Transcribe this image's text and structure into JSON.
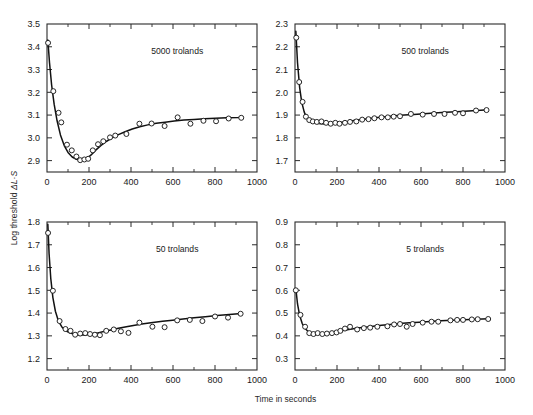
{
  "axes": {
    "ylabel_text": "Log threshold ",
    "ylabel_symbol": "ΔL·S",
    "xlabel": "Time in seconds"
  },
  "style": {
    "curve_color": "#111111",
    "marker_fill": "#ffffff",
    "marker_stroke": "#1a1a1a",
    "frame_color": "#2b2b2b",
    "background": "#ffffff"
  },
  "chart_data": [
    {
      "type": "scatter",
      "title": "5000 trolands",
      "panel": "top-left",
      "xlabel": "Time in seconds",
      "ylabel": "Log threshold ΔL·S",
      "xlim": [
        0,
        1000
      ],
      "ylim": [
        2.85,
        3.5
      ],
      "xticks": [
        0,
        200,
        400,
        600,
        800,
        1000
      ],
      "yticks": [
        2.9,
        3.0,
        3.1,
        3.2,
        3.3,
        3.4,
        3.5
      ],
      "ytick_labels": [
        "2.9",
        "3.0",
        "3.1",
        "3.2",
        "3.3",
        "3.4",
        "3.5"
      ],
      "xtick_labels": [
        "0",
        "200",
        "400",
        "600",
        "800",
        "1000"
      ],
      "minor_xtick_step": 100,
      "grid": false,
      "legend": null,
      "points": [
        [
          5,
          3.417
        ],
        [
          30,
          3.205
        ],
        [
          55,
          3.11
        ],
        [
          68,
          3.068
        ],
        [
          95,
          2.97
        ],
        [
          118,
          2.945
        ],
        [
          140,
          2.918
        ],
        [
          158,
          2.902
        ],
        [
          178,
          2.905
        ],
        [
          196,
          2.908
        ],
        [
          218,
          2.945
        ],
        [
          243,
          2.972
        ],
        [
          268,
          2.985
        ],
        [
          300,
          3.002
        ],
        [
          325,
          3.01
        ],
        [
          378,
          3.017
        ],
        [
          440,
          3.062
        ],
        [
          498,
          3.063
        ],
        [
          560,
          3.052
        ],
        [
          622,
          3.09
        ],
        [
          683,
          3.062
        ],
        [
          745,
          3.075
        ],
        [
          805,
          3.073
        ],
        [
          865,
          3.085
        ],
        [
          925,
          3.088
        ]
      ],
      "curve": [
        [
          4,
          3.43
        ],
        [
          12,
          3.33
        ],
        [
          22,
          3.232
        ],
        [
          34,
          3.148
        ],
        [
          48,
          3.075
        ],
        [
          64,
          3.013
        ],
        [
          82,
          2.966
        ],
        [
          100,
          2.936
        ],
        [
          120,
          2.916
        ],
        [
          140,
          2.906
        ],
        [
          160,
          2.902
        ],
        [
          175,
          2.903
        ],
        [
          190,
          2.909
        ],
        [
          210,
          2.925
        ],
        [
          232,
          2.946
        ],
        [
          256,
          2.966
        ],
        [
          282,
          2.984
        ],
        [
          310,
          3.0
        ],
        [
          340,
          3.014
        ],
        [
          372,
          3.027
        ],
        [
          406,
          3.039
        ],
        [
          442,
          3.049
        ],
        [
          480,
          3.057
        ],
        [
          520,
          3.064
        ],
        [
          562,
          3.069
        ],
        [
          606,
          3.074
        ],
        [
          652,
          3.078
        ],
        [
          700,
          3.081
        ],
        [
          750,
          3.084
        ],
        [
          802,
          3.086
        ],
        [
          856,
          3.088
        ],
        [
          912,
          3.089
        ],
        [
          932,
          3.09
        ]
      ]
    },
    {
      "type": "scatter",
      "title": "500 trolands",
      "panel": "top-right",
      "xlabel": "Time in seconds",
      "ylabel": "Log threshold ΔL·S",
      "xlim": [
        0,
        1000
      ],
      "ylim": [
        1.65,
        2.3
      ],
      "xticks": [
        0,
        200,
        400,
        600,
        800,
        1000
      ],
      "yticks": [
        1.7,
        1.8,
        1.9,
        2.0,
        2.1,
        2.2,
        2.3
      ],
      "ytick_labels": [
        "1.7",
        "1.8",
        "1.9",
        "2.0",
        "2.1",
        "2.2",
        "2.3"
      ],
      "xtick_labels": [
        "0",
        "200",
        "400",
        "600",
        "800",
        "1000"
      ],
      "minor_xtick_step": 100,
      "grid": false,
      "legend": null,
      "points": [
        [
          6,
          2.24
        ],
        [
          20,
          2.045
        ],
        [
          36,
          1.958
        ],
        [
          52,
          1.893
        ],
        [
          68,
          1.878
        ],
        [
          85,
          1.872
        ],
        [
          104,
          1.87
        ],
        [
          126,
          1.872
        ],
        [
          148,
          1.866
        ],
        [
          170,
          1.862
        ],
        [
          192,
          1.866
        ],
        [
          212,
          1.862
        ],
        [
          238,
          1.866
        ],
        [
          262,
          1.87
        ],
        [
          292,
          1.872
        ],
        [
          320,
          1.88
        ],
        [
          350,
          1.882
        ],
        [
          378,
          1.886
        ],
        [
          412,
          1.89
        ],
        [
          442,
          1.89
        ],
        [
          470,
          1.893
        ],
        [
          500,
          1.895
        ],
        [
          552,
          1.905
        ],
        [
          608,
          1.902
        ],
        [
          662,
          1.905
        ],
        [
          712,
          1.905
        ],
        [
          762,
          1.91
        ],
        [
          800,
          1.908
        ],
        [
          862,
          1.92
        ],
        [
          912,
          1.922
        ]
      ],
      "curve": [
        [
          4,
          2.268
        ],
        [
          12,
          2.13
        ],
        [
          22,
          2.022
        ],
        [
          32,
          1.957
        ],
        [
          44,
          1.913
        ],
        [
          56,
          1.888
        ],
        [
          70,
          1.874
        ],
        [
          86,
          1.867
        ],
        [
          104,
          1.864
        ],
        [
          124,
          1.862
        ],
        [
          146,
          1.861
        ],
        [
          170,
          1.862
        ],
        [
          196,
          1.864
        ],
        [
          224,
          1.868
        ],
        [
          254,
          1.872
        ],
        [
          286,
          1.877
        ],
        [
          320,
          1.881
        ],
        [
          356,
          1.885
        ],
        [
          394,
          1.889
        ],
        [
          434,
          1.893
        ],
        [
          476,
          1.897
        ],
        [
          520,
          1.9
        ],
        [
          566,
          1.903
        ],
        [
          614,
          1.906
        ],
        [
          664,
          1.909
        ],
        [
          716,
          1.912
        ],
        [
          770,
          1.915
        ],
        [
          826,
          1.918
        ],
        [
          884,
          1.921
        ],
        [
          920,
          1.923
        ]
      ]
    },
    {
      "type": "scatter",
      "title": "50 trolands",
      "panel": "bottom-left",
      "xlabel": "Time in seconds",
      "ylabel": "Log threshold ΔL·S",
      "xlim": [
        0,
        1000
      ],
      "ylim": [
        1.15,
        1.8
      ],
      "xticks": [
        0,
        200,
        400,
        600,
        800,
        1000
      ],
      "yticks": [
        1.2,
        1.3,
        1.4,
        1.5,
        1.6,
        1.7,
        1.8
      ],
      "ytick_labels": [
        "1.2",
        "1.3",
        "1.4",
        "1.5",
        "1.6",
        "1.7",
        "1.8"
      ],
      "xtick_labels": [
        "0",
        "200",
        "400",
        "600",
        "800",
        "1000"
      ],
      "minor_xtick_step": 100,
      "grid": false,
      "legend": null,
      "points": [
        [
          5,
          1.752
        ],
        [
          28,
          1.498
        ],
        [
          60,
          1.365
        ],
        [
          88,
          1.33
        ],
        [
          112,
          1.322
        ],
        [
          134,
          1.305
        ],
        [
          158,
          1.31
        ],
        [
          182,
          1.312
        ],
        [
          205,
          1.308
        ],
        [
          228,
          1.305
        ],
        [
          252,
          1.303
        ],
        [
          282,
          1.322
        ],
        [
          318,
          1.328
        ],
        [
          352,
          1.32
        ],
        [
          388,
          1.313
        ],
        [
          440,
          1.358
        ],
        [
          502,
          1.34
        ],
        [
          560,
          1.338
        ],
        [
          620,
          1.368
        ],
        [
          680,
          1.37
        ],
        [
          740,
          1.365
        ],
        [
          800,
          1.385
        ],
        [
          862,
          1.38
        ],
        [
          922,
          1.397
        ]
      ],
      "curve": [
        [
          4,
          1.79
        ],
        [
          10,
          1.66
        ],
        [
          18,
          1.552
        ],
        [
          28,
          1.468
        ],
        [
          40,
          1.408
        ],
        [
          54,
          1.366
        ],
        [
          70,
          1.34
        ],
        [
          88,
          1.323
        ],
        [
          108,
          1.313
        ],
        [
          130,
          1.307
        ],
        [
          154,
          1.304
        ],
        [
          180,
          1.304
        ],
        [
          208,
          1.307
        ],
        [
          238,
          1.312
        ],
        [
          270,
          1.319
        ],
        [
          304,
          1.326
        ],
        [
          340,
          1.333
        ],
        [
          378,
          1.34
        ],
        [
          418,
          1.347
        ],
        [
          460,
          1.353
        ],
        [
          504,
          1.359
        ],
        [
          550,
          1.364
        ],
        [
          598,
          1.369
        ],
        [
          648,
          1.374
        ],
        [
          700,
          1.379
        ],
        [
          754,
          1.384
        ],
        [
          810,
          1.389
        ],
        [
          868,
          1.394
        ],
        [
          925,
          1.398
        ]
      ]
    },
    {
      "type": "scatter",
      "title": "5 trolands",
      "panel": "bottom-right",
      "xlabel": "Time in seconds",
      "ylabel": "Log threshold ΔL·S",
      "xlim": [
        0,
        1000
      ],
      "ylim": [
        0.25,
        0.9
      ],
      "xticks": [
        0,
        200,
        400,
        600,
        800,
        1000
      ],
      "yticks": [
        0.3,
        0.4,
        0.5,
        0.6,
        0.7,
        0.8,
        0.9
      ],
      "ytick_labels": [
        "0.3",
        "0.4",
        "0.5",
        "0.6",
        "0.7",
        "0.8",
        "0.9"
      ],
      "xtick_labels": [
        "0",
        "200",
        "400",
        "600",
        "800",
        "1000"
      ],
      "minor_xtick_step": 100,
      "grid": false,
      "legend": null,
      "points": [
        [
          4,
          0.6
        ],
        [
          26,
          0.492
        ],
        [
          48,
          0.44
        ],
        [
          68,
          0.412
        ],
        [
          88,
          0.408
        ],
        [
          108,
          0.412
        ],
        [
          130,
          0.408
        ],
        [
          152,
          0.41
        ],
        [
          176,
          0.412
        ],
        [
          198,
          0.415
        ],
        [
          216,
          0.422
        ],
        [
          238,
          0.432
        ],
        [
          262,
          0.44
        ],
        [
          296,
          0.428
        ],
        [
          328,
          0.434
        ],
        [
          358,
          0.436
        ],
        [
          392,
          0.44
        ],
        [
          440,
          0.442
        ],
        [
          472,
          0.45
        ],
        [
          500,
          0.452
        ],
        [
          532,
          0.44
        ],
        [
          560,
          0.452
        ],
        [
          608,
          0.458
        ],
        [
          650,
          0.462
        ],
        [
          682,
          0.462
        ],
        [
          740,
          0.468
        ],
        [
          772,
          0.47
        ],
        [
          800,
          0.47
        ],
        [
          842,
          0.472
        ],
        [
          870,
          0.473
        ],
        [
          920,
          0.474
        ]
      ],
      "curve": [
        [
          4,
          0.608
        ],
        [
          12,
          0.54
        ],
        [
          22,
          0.49
        ],
        [
          34,
          0.455
        ],
        [
          48,
          0.432
        ],
        [
          64,
          0.418
        ],
        [
          82,
          0.411
        ],
        [
          102,
          0.408
        ],
        [
          124,
          0.408
        ],
        [
          148,
          0.41
        ],
        [
          174,
          0.414
        ],
        [
          202,
          0.419
        ],
        [
          232,
          0.424
        ],
        [
          264,
          0.429
        ],
        [
          298,
          0.434
        ],
        [
          334,
          0.438
        ],
        [
          372,
          0.442
        ],
        [
          412,
          0.446
        ],
        [
          454,
          0.45
        ],
        [
          498,
          0.454
        ],
        [
          544,
          0.457
        ],
        [
          592,
          0.46
        ],
        [
          642,
          0.463
        ],
        [
          694,
          0.466
        ],
        [
          748,
          0.469
        ],
        [
          804,
          0.471
        ],
        [
          862,
          0.473
        ],
        [
          920,
          0.475
        ]
      ]
    }
  ]
}
